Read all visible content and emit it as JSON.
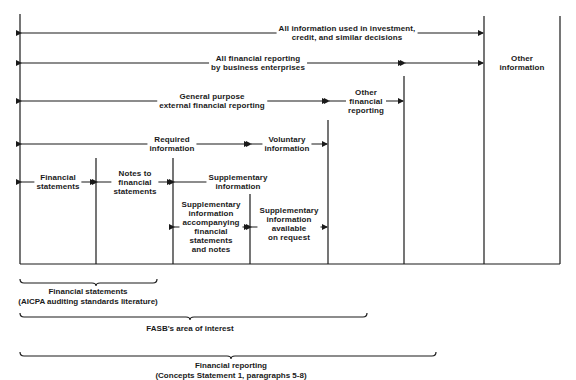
{
  "diagram": {
    "ranges": [
      {
        "id": "all-information",
        "label": "All information used in investment,\ncredit, and similar decisions"
      },
      {
        "id": "all-financial-reporting",
        "label": "All financial reporting\nby business enterprises"
      },
      {
        "id": "other-information",
        "label": "Other\ninformation"
      },
      {
        "id": "general-purpose",
        "label": "General purpose\nexternal financial reporting"
      },
      {
        "id": "other-financial-reporting",
        "label": "Other\nfinancial\nreporting"
      },
      {
        "id": "required-information",
        "label": "Required\ninformation"
      },
      {
        "id": "voluntary-information",
        "label": "Voluntary\ninformation"
      },
      {
        "id": "financial-statements",
        "label": "Financial\nstatements"
      },
      {
        "id": "notes",
        "label": "Notes to\nfinancial\nstatements"
      },
      {
        "id": "supplementary-information",
        "label": "Supplementary\ninformation"
      },
      {
        "id": "supplementary-accompanying",
        "label": "Supplementary\ninformation\naccompanying\nfinancial\nstatements\nand notes"
      },
      {
        "id": "supplementary-on-request",
        "label": "Supplementary\ninformation\navailable\non request"
      }
    ],
    "braces": [
      {
        "id": "brace-financial-statements",
        "label": "Financial statements\n(AICPA auditing standards literature)"
      },
      {
        "id": "brace-fasb",
        "label": "FASB's area of interest"
      },
      {
        "id": "brace-financial-reporting",
        "label": "Financial reporting\n(Concepts Statement 1, paragraphs 5-8)"
      }
    ]
  }
}
